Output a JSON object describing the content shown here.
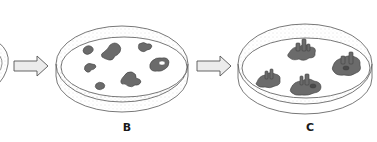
{
  "figure": {
    "panels": [
      {
        "id": "A",
        "label": "",
        "visible": "partial",
        "content": "cropped dish at left edge"
      },
      {
        "id": "B",
        "label": "B",
        "content": "flat irregular colonies on agar surface",
        "colony_count": 6
      },
      {
        "id": "C",
        "label": "C",
        "content": "raised 3D colony structures with tower-like projections",
        "colony_count": 4
      }
    ],
    "arrows": [
      {
        "from": "A",
        "to": "B"
      },
      {
        "from": "B",
        "to": "C"
      }
    ],
    "colors": {
      "outline": "#555555",
      "colony_fill": "#6b6b6b",
      "colony_dark": "#4a4a4a",
      "arrow_fill": "#ececec",
      "stipple": "#bdbdbd"
    }
  }
}
